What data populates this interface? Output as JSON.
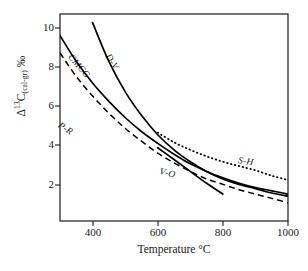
{
  "chart_data": {
    "type": "line",
    "title": "",
    "xlabel": "Temperature  °C",
    "ylabel": "Δ13C(cal-gr) ‰",
    "ylabel_parts": {
      "delta": "Δ",
      "sup": "13",
      "c": "C",
      "sub": "(cal-gr)",
      "permil": "‰"
    },
    "xlim": [
      300,
      1000
    ],
    "ylim": [
      1.2,
      10.8
    ],
    "xticks": [
      400,
      600,
      800,
      1000
    ],
    "xtick_labels": [
      "400",
      "600",
      "800",
      "1000"
    ],
    "yticks": [
      2,
      4,
      6,
      8,
      10
    ],
    "ytick_labels": [
      "2",
      "4",
      "6",
      "8",
      "10"
    ],
    "grid": false,
    "legend": "inline-curve-labels",
    "series": [
      {
        "name": "D-V",
        "label": "D-V",
        "style": "solid",
        "color": "#000000",
        "x": [
          400,
          450,
          500,
          550,
          600,
          650,
          700,
          750,
          800,
          850,
          900,
          950,
          1000
        ],
        "y": [
          10.4,
          8.6,
          7.2,
          6.1,
          5.2,
          4.5,
          3.95,
          3.5,
          3.15,
          2.9,
          2.7,
          2.5,
          2.35
        ]
      },
      {
        "name": "CMCG",
        "label": "CMCG",
        "style": "solid",
        "color": "#000000",
        "x": [
          300,
          350,
          400,
          450,
          500,
          550,
          600,
          650,
          700,
          750,
          800,
          850,
          900,
          950,
          1000
        ],
        "y": [
          9.8,
          8.6,
          7.6,
          6.75,
          6.0,
          5.35,
          4.8,
          4.3,
          3.85,
          3.5,
          3.2,
          2.95,
          2.75,
          2.6,
          2.45
        ]
      },
      {
        "name": "P-R",
        "label": "P-R",
        "style": "dashed",
        "color": "#000000",
        "x": [
          300,
          350,
          400,
          450,
          500,
          550,
          600,
          650,
          700,
          750,
          800,
          850,
          900,
          950,
          1000
        ],
        "y": [
          9.0,
          7.9,
          7.0,
          6.2,
          5.5,
          4.9,
          4.35,
          3.9,
          3.5,
          3.15,
          2.9,
          2.65,
          2.45,
          2.25,
          2.05
        ]
      },
      {
        "name": "V-O",
        "label": "V-O",
        "style": "solid",
        "color": "#000000",
        "x": [
          600,
          650,
          700,
          750,
          800
        ],
        "y": [
          4.6,
          4.05,
          3.5,
          2.95,
          2.45
        ]
      },
      {
        "name": "S-H",
        "label": "S-H",
        "style": "dotted",
        "color": "#000000",
        "x": [
          600,
          650,
          700,
          750,
          800,
          850,
          900,
          950,
          1000
        ],
        "y": [
          5.3,
          4.85,
          4.5,
          4.2,
          3.95,
          3.75,
          3.55,
          3.3,
          3.1
        ]
      }
    ]
  },
  "axes": {
    "x_title": "Temperature  °C",
    "xtick_400": "400",
    "xtick_600": "600",
    "xtick_800": "800",
    "xtick_1000": "1000",
    "ytick_2": "2",
    "ytick_4": "4",
    "ytick_6": "6",
    "ytick_8": "8",
    "ytick_10": "10"
  },
  "curve_labels": {
    "dv": "D-V",
    "cmcg": "CMCG",
    "pr": "P-R",
    "vo": "V-O",
    "sh": "S-H"
  },
  "colors": {
    "axis": "#1a1a1a",
    "curve": "#000000",
    "background": "#ffffff"
  }
}
